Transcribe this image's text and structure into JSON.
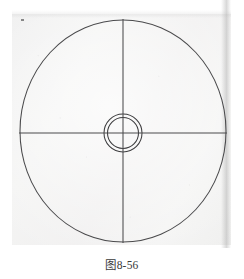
{
  "figure": {
    "caption": "图8-56",
    "caption_label": "figure-number",
    "background_color": "#f1f1f0",
    "page_color": "#ffffff",
    "line_color": "#4a4a4c"
  },
  "chart_data": {
    "type": "diagram",
    "title": "图8-56",
    "units": "px",
    "canvas": {
      "width": 244,
      "height": 279
    },
    "shapes": [
      {
        "name": "outer-circle",
        "kind": "ellipse",
        "cx": 123,
        "cy": 131,
        "rx": 103,
        "ry": 111,
        "stroke": "#4a4a4c",
        "stroke_width": 1,
        "fill": "none"
      },
      {
        "name": "center-circle-outer",
        "kind": "circle",
        "cx": 123,
        "cy": 133,
        "r": 19,
        "stroke": "#3c3c3e",
        "stroke_width": 1,
        "fill": "none"
      },
      {
        "name": "center-circle-inner",
        "kind": "circle",
        "cx": 123,
        "cy": 133,
        "r": 15.5,
        "stroke": "#3c3c3e",
        "stroke_width": 1,
        "fill": "none"
      },
      {
        "name": "horizontal-centerline",
        "kind": "line",
        "x1": 19,
        "y1": 133,
        "x2": 227,
        "y2": 133,
        "stroke": "#4a4a4c",
        "stroke_width": 1
      },
      {
        "name": "vertical-centerline",
        "kind": "line",
        "x1": 123,
        "y1": 19,
        "x2": 123,
        "y2": 243,
        "stroke": "#4a4a4c",
        "stroke_width": 1
      }
    ],
    "annotations": [
      {
        "name": "caption",
        "text": "图8-56",
        "x": 122,
        "y": 266,
        "anchor": "middle"
      }
    ],
    "legend": null,
    "grid": false
  }
}
